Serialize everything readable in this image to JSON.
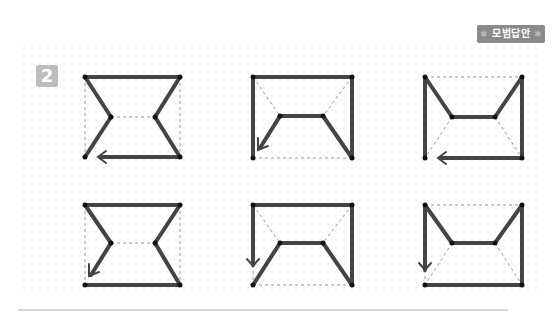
{
  "badge": {
    "label": "모범답안",
    "star_left": "✱",
    "star_right": "✱"
  },
  "problem": {
    "number": "2"
  },
  "colors": {
    "stroke": "#444444",
    "dash": "#9a9a9a",
    "badge_bg": "#8a8a8a",
    "number_bg": "#bdbdbd"
  },
  "figures": [
    {
      "id": "r1c1",
      "row": 1,
      "col": 1,
      "shape": "hourglass",
      "arrow_direction": "left"
    },
    {
      "id": "r1c2",
      "row": 1,
      "col": 2,
      "shape": "trapezoid-open-bottom",
      "arrow_direction": "down-left"
    },
    {
      "id": "r1c3",
      "row": 1,
      "col": 3,
      "shape": "crown",
      "arrow_direction": "left"
    },
    {
      "id": "r2c1",
      "row": 2,
      "col": 1,
      "shape": "hourglass",
      "arrow_direction": "down-left"
    },
    {
      "id": "r2c2",
      "row": 2,
      "col": 2,
      "shape": "trapezoid-open-bottom",
      "arrow_direction": "down"
    },
    {
      "id": "r2c3",
      "row": 2,
      "col": 3,
      "shape": "crown",
      "arrow_direction": "down"
    }
  ]
}
